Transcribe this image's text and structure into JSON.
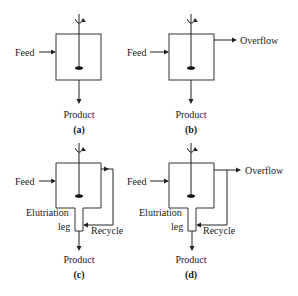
{
  "diagram": {
    "type": "crystallizer-configurations",
    "panels": [
      {
        "id": "a",
        "caption": "(a)",
        "labels": {
          "feed": "Feed",
          "product": "Product"
        }
      },
      {
        "id": "b",
        "caption": "(b)",
        "labels": {
          "feed": "Feed",
          "product": "Product",
          "overflow": "Overflow"
        }
      },
      {
        "id": "c",
        "caption": "(c)",
        "labels": {
          "feed": "Feed",
          "product": "Product",
          "elutriation_1": "Elutriation",
          "elutriation_2": "leg",
          "recycle": "Recycle"
        }
      },
      {
        "id": "d",
        "caption": "(d)",
        "labels": {
          "feed": "Feed",
          "product": "Product",
          "overflow": "Overflow",
          "elutriation_1": "Elutriation",
          "elutriation_2": "leg",
          "recycle": "Recycle"
        }
      }
    ],
    "colors": {
      "line": "#222222",
      "vessel": "#333333",
      "background": "#ffffff"
    }
  }
}
